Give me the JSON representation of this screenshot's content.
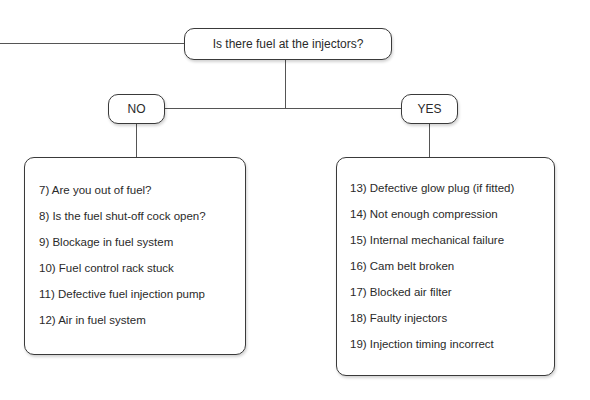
{
  "question": "Is there fuel at the injectors?",
  "branches": {
    "no": {
      "label": "NO",
      "items": [
        "7) Are you out of fuel?",
        "8) Is the fuel shut-off cock open?",
        "9) Blockage in fuel system",
        "10) Fuel control rack stuck",
        "11) Defective fuel injection pump",
        "12) Air in fuel system"
      ]
    },
    "yes": {
      "label": "YES",
      "items": [
        "13) Defective glow plug (if fitted)",
        "14) Not enough compression",
        "15) Internal mechanical failure",
        "16) Cam belt broken",
        "17) Blocked air filter",
        "18) Faulty injectors",
        "19) Injection timing incorrect"
      ]
    }
  }
}
